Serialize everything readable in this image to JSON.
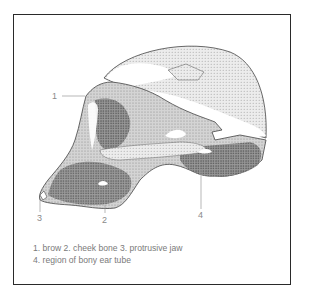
{
  "figure": {
    "labels": [
      {
        "num": "1",
        "name": "brow"
      },
      {
        "num": "2",
        "name": "cheek bone"
      },
      {
        "num": "3",
        "name": "protrusive jaw"
      },
      {
        "num": "4",
        "name": "region of bony ear tube"
      }
    ],
    "caption": {
      "line1": "1. brow 2. cheek bone 3. protrusive jaw",
      "line2": "4. region of bony ear tube"
    }
  },
  "colors": {
    "frame": "#2a2a2a",
    "label_text": "#8a8a8a",
    "bone_dark": "#3a3a3a",
    "bone_mid": "#8c8c8c",
    "bone_light": "#c8c8c8"
  }
}
